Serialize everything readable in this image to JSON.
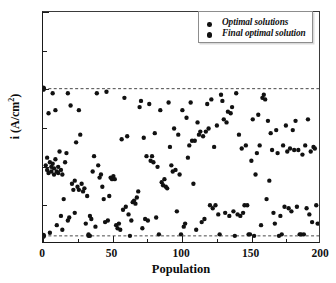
{
  "chart_data": {
    "type": "scatter",
    "title": "",
    "xlabel": "Population",
    "ylabel": "i (A/cm",
    "ylabel_sup": "2",
    "ylabel_tail": ")",
    "xlim": [
      0,
      200
    ],
    "ylim": [
      0.0,
      1.5
    ],
    "grid": false,
    "legend_position": "top-right",
    "xticks": [
      0,
      50,
      100,
      150,
      200
    ],
    "xtick_labels": [
      "0",
      "50",
      "100",
      "150",
      "200"
    ],
    "xminor_step": 25,
    "yticks": [
      0.0,
      0.5,
      1.0,
      1.5
    ],
    "ytick_labels": [
      "0.0",
      "0.5",
      "1.0",
      "1.5"
    ],
    "yminor_step": 0.25,
    "marker_color": "#111111",
    "reference_lines": [
      {
        "name": "upper-bound",
        "y": 1.0,
        "style": "dashed",
        "color": "#333333"
      },
      {
        "name": "lower-bound",
        "y": 0.04,
        "style": "dashed",
        "color": "#333333"
      }
    ],
    "series": [
      {
        "name": "Optimal solutions",
        "marker": "circle",
        "color": "#111111",
        "size": 4.4,
        "points": [
          [
            2,
            0.5
          ],
          [
            3,
            0.47
          ],
          [
            3,
            0.55
          ],
          [
            4,
            0.84
          ],
          [
            4,
            0.45
          ],
          [
            5,
            0.52
          ],
          [
            5,
            0.06
          ],
          [
            6,
            0.49
          ],
          [
            6,
            0.46
          ],
          [
            7,
            0.97
          ],
          [
            7,
            0.51
          ],
          [
            8,
            0.44
          ],
          [
            8,
            0.48
          ],
          [
            9,
            0.86
          ],
          [
            9,
            0.54
          ],
          [
            10,
            0.46
          ],
          [
            10,
            0.11
          ],
          [
            11,
            0.45
          ],
          [
            11,
            0.49
          ],
          [
            12,
            0.59
          ],
          [
            13,
            0.47
          ],
          [
            13,
            0.17
          ],
          [
            14,
            0.44
          ],
          [
            14,
            0.08
          ],
          [
            15,
            0.28
          ],
          [
            16,
            0.52
          ],
          [
            17,
            0.58
          ],
          [
            18,
            0.97
          ],
          [
            18,
            0.14
          ],
          [
            19,
            0.16
          ],
          [
            20,
            0.89
          ],
          [
            21,
            0.38
          ],
          [
            22,
            0.34
          ],
          [
            23,
            0.4
          ],
          [
            23,
            0.19
          ],
          [
            24,
            0.65
          ],
          [
            25,
            0.36
          ],
          [
            26,
            0.86
          ],
          [
            26,
            0.34
          ],
          [
            27,
            0.7
          ],
          [
            28,
            0.38
          ],
          [
            29,
            0.33
          ],
          [
            30,
            0.35
          ],
          [
            31,
            0.12
          ],
          [
            32,
            0.3
          ],
          [
            33,
            0.04
          ],
          [
            33,
            0.05
          ],
          [
            34,
            0.04
          ],
          [
            34,
            0.17
          ],
          [
            35,
            0.15
          ],
          [
            36,
            0.46
          ],
          [
            37,
            0.56
          ],
          [
            38,
            0.1
          ],
          [
            39,
            0.97
          ],
          [
            40,
            0.5
          ],
          [
            41,
            0.42
          ],
          [
            42,
            0.44
          ],
          [
            43,
            0.36
          ],
          [
            44,
            0.28
          ],
          [
            45,
            0.13
          ],
          [
            46,
            0.98
          ],
          [
            47,
            0.14
          ],
          [
            48,
            0.3
          ],
          [
            49,
            0.42
          ],
          [
            50,
            0.41
          ],
          [
            51,
            0.43
          ],
          [
            52,
            0.41
          ],
          [
            53,
            0.11
          ],
          [
            54,
            0.09
          ],
          [
            55,
            0.12
          ],
          [
            56,
            0.08
          ],
          [
            57,
            0.67
          ],
          [
            58,
            0.21
          ],
          [
            59,
            0.94
          ],
          [
            60,
            0.23
          ],
          [
            61,
            0.69
          ],
          [
            62,
            0.18
          ],
          [
            63,
            0.04
          ],
          [
            64,
            0.14
          ],
          [
            65,
            0.26
          ],
          [
            66,
            0.27
          ],
          [
            67,
            0.25
          ],
          [
            68,
            0.29
          ],
          [
            69,
            0.33
          ],
          [
            70,
            0.88
          ],
          [
            71,
            0.92
          ],
          [
            72,
            0.09
          ],
          [
            73,
            0.68
          ],
          [
            74,
            0.15
          ],
          [
            75,
            0.56
          ],
          [
            76,
            0.14
          ],
          [
            77,
            0.9
          ],
          [
            78,
            0.53
          ],
          [
            79,
            0.56
          ],
          [
            80,
            0.52
          ],
          [
            81,
            0.71
          ],
          [
            82,
            0.16
          ],
          [
            83,
            0.49
          ],
          [
            84,
            0.05
          ],
          [
            85,
            0.86
          ],
          [
            86,
            0.39
          ],
          [
            87,
            0.37
          ],
          [
            88,
            0.41
          ],
          [
            89,
            0.36
          ],
          [
            90,
            0.35
          ],
          [
            91,
            0.91
          ],
          [
            92,
            0.62
          ],
          [
            93,
            0.5
          ],
          [
            94,
            0.46
          ],
          [
            95,
            0.74
          ],
          [
            96,
            0.47
          ],
          [
            97,
            0.2
          ],
          [
            98,
            0.7
          ],
          [
            99,
            0.44
          ],
          [
            100,
            0.05
          ],
          [
            101,
            0.86
          ],
          [
            102,
            0.1
          ],
          [
            103,
            0.12
          ],
          [
            104,
            0.81
          ],
          [
            105,
            0.55
          ],
          [
            106,
            0.63
          ],
          [
            107,
            0.91
          ],
          [
            108,
            0.66
          ],
          [
            109,
            0.38
          ],
          [
            110,
            0.66
          ],
          [
            111,
            0.08
          ],
          [
            112,
            0.78
          ],
          [
            113,
            0.7
          ],
          [
            114,
            0.72
          ],
          [
            115,
            0.13
          ],
          [
            116,
            0.69
          ],
          [
            117,
            0.15
          ],
          [
            118,
            0.72
          ],
          [
            119,
            0.9
          ],
          [
            120,
            0.74
          ],
          [
            121,
            0.24
          ],
          [
            122,
            0.93
          ],
          [
            123,
            0.22
          ],
          [
            124,
            0.62
          ],
          [
            125,
            0.24
          ],
          [
            126,
            0.76
          ],
          [
            127,
            0.18
          ],
          [
            128,
            0.05
          ],
          [
            129,
            0.96
          ],
          [
            130,
            0.92
          ],
          [
            131,
            0.8
          ],
          [
            132,
            0.19
          ],
          [
            133,
            0.78
          ],
          [
            134,
            0.85
          ],
          [
            135,
            0.17
          ],
          [
            136,
            0.84
          ],
          [
            137,
            0.88
          ],
          [
            138,
            0.2
          ],
          [
            139,
            0.04
          ],
          [
            140,
            0.97
          ],
          [
            141,
            0.18
          ],
          [
            142,
            0.7
          ],
          [
            143,
            0.17
          ],
          [
            144,
            0.61
          ],
          [
            145,
            0.19
          ],
          [
            146,
            0.24
          ],
          [
            147,
            0.63
          ],
          [
            148,
            0.24
          ],
          [
            149,
            0.05
          ],
          [
            150,
            0.05
          ],
          [
            151,
            0.53
          ],
          [
            152,
            0.8
          ],
          [
            153,
            0.04
          ],
          [
            154,
            0.44
          ],
          [
            155,
            0.58
          ],
          [
            156,
            0.83
          ],
          [
            157,
            0.63
          ],
          [
            158,
            0.11
          ],
          [
            159,
            0.94
          ],
          [
            160,
            0.96
          ],
          [
            161,
            0.93
          ],
          [
            162,
            0.28
          ],
          [
            163,
            0.79
          ],
          [
            164,
            0.4
          ],
          [
            165,
            0.71
          ],
          [
            166,
            0.6
          ],
          [
            167,
            0.19
          ],
          [
            168,
            0.12
          ],
          [
            169,
            0.73
          ],
          [
            170,
            0.58
          ],
          [
            171,
            0.04
          ],
          [
            172,
            0.17
          ],
          [
            173,
            0.05
          ],
          [
            174,
            0.63
          ],
          [
            175,
            0.23
          ],
          [
            176,
            0.76
          ],
          [
            177,
            0.59
          ],
          [
            178,
            0.22
          ],
          [
            179,
            0.61
          ],
          [
            180,
            0.2
          ],
          [
            181,
            0.73
          ],
          [
            182,
            0.6
          ],
          [
            183,
            0.79
          ],
          [
            184,
            0.23
          ],
          [
            185,
            0.6
          ],
          [
            186,
            0.05
          ],
          [
            187,
            0.05
          ],
          [
            188,
            0.57
          ],
          [
            189,
            0.05
          ],
          [
            190,
            0.63
          ],
          [
            191,
            0.22
          ],
          [
            192,
            0.8
          ],
          [
            193,
            0.18
          ],
          [
            194,
            0.59
          ],
          [
            195,
            0.13
          ],
          [
            196,
            0.62
          ],
          [
            197,
            0.61
          ],
          [
            198,
            0.24
          ],
          [
            199,
            0.12
          ]
        ]
      },
      {
        "name": "Final optimal solution",
        "marker": "circle",
        "color": "#111111",
        "size": 6.2,
        "points": [
          [
            0,
            1.0
          ],
          [
            0,
            0.04
          ]
        ]
      }
    ]
  },
  "legend": {
    "entries": [
      {
        "label": "Optimal solutions"
      },
      {
        "label": "Final optimal solution"
      }
    ]
  }
}
